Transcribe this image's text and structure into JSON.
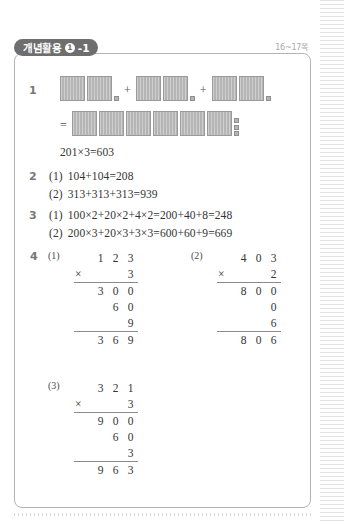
{
  "header": {
    "tab_label": "개념활용",
    "tab_badge": "1",
    "tab_suffix": "-1",
    "page_ref": "16~17쪽"
  },
  "problems": {
    "p1": {
      "number": "1",
      "blocks": {
        "addend_groups": [
          {
            "hundreds": 2,
            "ones": 1
          },
          {
            "hundreds": 2,
            "ones": 1
          },
          {
            "hundreds": 2,
            "ones": 1
          }
        ],
        "plus": "+",
        "equals": "=",
        "result_group": {
          "hundreds": 6,
          "ones": 3
        }
      },
      "equation": "201×3=603"
    },
    "p2": {
      "number": "2",
      "items": [
        {
          "label": "(1)",
          "text": "104+104=208"
        },
        {
          "label": "(2)",
          "text": "313+313+313=939"
        }
      ]
    },
    "p3": {
      "number": "3",
      "items": [
        {
          "label": "(1)",
          "text": "100×2+20×2+4×2=200+40+8=248"
        },
        {
          "label": "(2)",
          "text": "200×3+20×3+3×3=600+60+9=669"
        }
      ]
    },
    "p4": {
      "number": "4",
      "items": [
        {
          "label": "(1)",
          "multiplicand": [
            "1",
            "2",
            "3"
          ],
          "operator": "×",
          "multiplier": "3",
          "partials": [
            [
              "3",
              "0",
              "0"
            ],
            [
              "",
              "6",
              "0"
            ],
            [
              "",
              "",
              "9"
            ]
          ],
          "product": [
            "3",
            "6",
            "9"
          ]
        },
        {
          "label": "(2)",
          "multiplicand": [
            "4",
            "0",
            "3"
          ],
          "operator": "×",
          "multiplier": "2",
          "partials": [
            [
              "8",
              "0",
              "0"
            ],
            [
              "",
              "",
              "0"
            ],
            [
              "",
              "",
              "6"
            ]
          ],
          "product": [
            "8",
            "0",
            "6"
          ]
        },
        {
          "label": "(3)",
          "multiplicand": [
            "3",
            "2",
            "1"
          ],
          "operator": "×",
          "multiplier": "3",
          "partials": [
            [
              "9",
              "0",
              "0"
            ],
            [
              "",
              "6",
              "0"
            ],
            [
              "",
              "",
              "3"
            ]
          ],
          "product": [
            "9",
            "6",
            "3"
          ]
        }
      ]
    }
  }
}
